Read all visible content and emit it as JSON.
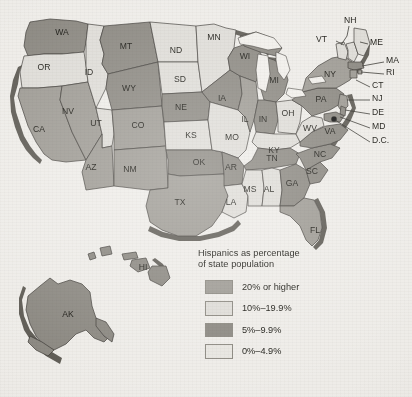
{
  "figure": {
    "background_color": "#eeece8",
    "outline_color": "#3a3732",
    "shadow_color": "#5d5a53",
    "lake_color": "#f1efeb",
    "dc_dot_color": "#111111"
  },
  "legend": {
    "title_line1": "Hispanics as percentage",
    "title_line2": "of state population",
    "items": [
      {
        "label": "20% or higher",
        "color": "#9d9a93"
      },
      {
        "label": "10%–19.9%",
        "color": "#dedcd7"
      },
      {
        "label": "5%–9.9%",
        "color": "#8a8780"
      },
      {
        "label": "0%–4.9%",
        "color": "#e7e5e0"
      }
    ]
  },
  "chart_data": {
    "type": "choropleth",
    "title": "Hispanics as percentage of state population",
    "xlabel": "",
    "ylabel": "",
    "grid": false,
    "legend_position": "bottom-center-right",
    "unit": "percent of state population",
    "bin_labels": [
      "20% or higher",
      "10%–19.9%",
      "5%–9.9%",
      "0%–4.9%"
    ],
    "bin_colors": [
      "#9d9a93",
      "#dedcd7",
      "#8a8780",
      "#e7e5e0"
    ],
    "states": [
      {
        "code": "WA",
        "bin": 2
      },
      {
        "code": "OR",
        "bin": 1
      },
      {
        "code": "CA",
        "bin": 0
      },
      {
        "code": "NV",
        "bin": 0
      },
      {
        "code": "ID",
        "bin": 1
      },
      {
        "code": "MT",
        "bin": 2
      },
      {
        "code": "WY",
        "bin": 2
      },
      {
        "code": "UT",
        "bin": 1
      },
      {
        "code": "AZ",
        "bin": 0
      },
      {
        "code": "CO",
        "bin": 0
      },
      {
        "code": "NM",
        "bin": 0
      },
      {
        "code": "ND",
        "bin": 1
      },
      {
        "code": "SD",
        "bin": 1
      },
      {
        "code": "NE",
        "bin": 2
      },
      {
        "code": "KS",
        "bin": 1
      },
      {
        "code": "OK",
        "bin": 2
      },
      {
        "code": "TX",
        "bin": 0
      },
      {
        "code": "MN",
        "bin": 1
      },
      {
        "code": "IA",
        "bin": 2
      },
      {
        "code": "MO",
        "bin": 1
      },
      {
        "code": "AR",
        "bin": 2
      },
      {
        "code": "LA",
        "bin": 1
      },
      {
        "code": "WI",
        "bin": 2
      },
      {
        "code": "IL",
        "bin": 0
      },
      {
        "code": "MI",
        "bin": 2
      },
      {
        "code": "IN",
        "bin": 2
      },
      {
        "code": "OH",
        "bin": 1
      },
      {
        "code": "KY",
        "bin": 1
      },
      {
        "code": "TN",
        "bin": 2
      },
      {
        "code": "MS",
        "bin": 1
      },
      {
        "code": "AL",
        "bin": 1
      },
      {
        "code": "GA",
        "bin": 2
      },
      {
        "code": "FL",
        "bin": 0
      },
      {
        "code": "SC",
        "bin": 2
      },
      {
        "code": "NC",
        "bin": 2
      },
      {
        "code": "VA",
        "bin": 2
      },
      {
        "code": "WV",
        "bin": 1
      },
      {
        "code": "PA",
        "bin": 2
      },
      {
        "code": "NY",
        "bin": 0
      },
      {
        "code": "VT",
        "bin": 1
      },
      {
        "code": "NH",
        "bin": 1
      },
      {
        "code": "ME",
        "bin": 1
      },
      {
        "code": "MA",
        "bin": 2
      },
      {
        "code": "RI",
        "bin": 0
      },
      {
        "code": "CT",
        "bin": 0
      },
      {
        "code": "NJ",
        "bin": 0
      },
      {
        "code": "DE",
        "bin": 2
      },
      {
        "code": "MD",
        "bin": 2
      },
      {
        "code": "D.C.",
        "bin": 2
      },
      {
        "code": "AK",
        "bin": 2
      },
      {
        "code": "HI",
        "bin": 2
      }
    ]
  },
  "labels": {
    "inline": [
      {
        "code": "WA",
        "x": 62,
        "y": 33
      },
      {
        "code": "OR",
        "x": 44,
        "y": 68
      },
      {
        "code": "CA",
        "x": 39,
        "y": 130
      },
      {
        "code": "NV",
        "x": 68,
        "y": 112
      },
      {
        "code": "ID",
        "x": 89,
        "y": 73
      },
      {
        "code": "MT",
        "x": 126,
        "y": 47
      },
      {
        "code": "WY",
        "x": 129,
        "y": 89
      },
      {
        "code": "UT",
        "x": 96,
        "y": 124
      },
      {
        "code": "AZ",
        "x": 91,
        "y": 168
      },
      {
        "code": "CO",
        "x": 138,
        "y": 126
      },
      {
        "code": "NM",
        "x": 130,
        "y": 170
      },
      {
        "code": "ND",
        "x": 176,
        "y": 51
      },
      {
        "code": "SD",
        "x": 180,
        "y": 80
      },
      {
        "code": "NE",
        "x": 181,
        "y": 108
      },
      {
        "code": "KS",
        "x": 191,
        "y": 136
      },
      {
        "code": "OK",
        "x": 199,
        "y": 163
      },
      {
        "code": "TX",
        "x": 180,
        "y": 203
      },
      {
        "code": "MN",
        "x": 214,
        "y": 38
      },
      {
        "code": "IA",
        "x": 222,
        "y": 99
      },
      {
        "code": "MO",
        "x": 232,
        "y": 138
      },
      {
        "code": "AR",
        "x": 231,
        "y": 168
      },
      {
        "code": "LA",
        "x": 231,
        "y": 203
      },
      {
        "code": "WI",
        "x": 245,
        "y": 57
      },
      {
        "code": "IL",
        "x": 245,
        "y": 120
      },
      {
        "code": "MI",
        "x": 274,
        "y": 81
      },
      {
        "code": "IN",
        "x": 263,
        "y": 120
      },
      {
        "code": "OH",
        "x": 288,
        "y": 114
      },
      {
        "code": "KY",
        "x": 274,
        "y": 151
      },
      {
        "code": "TN",
        "x": 272,
        "y": 159
      },
      {
        "code": "MS",
        "x": 250,
        "y": 190
      },
      {
        "code": "AL",
        "x": 269,
        "y": 190
      },
      {
        "code": "GA",
        "x": 292,
        "y": 184
      },
      {
        "code": "FL",
        "x": 315,
        "y": 231
      },
      {
        "code": "SC",
        "x": 312,
        "y": 172
      },
      {
        "code": "NC",
        "x": 320,
        "y": 155
      },
      {
        "code": "VA",
        "x": 330,
        "y": 132
      },
      {
        "code": "WV",
        "x": 310,
        "y": 129
      },
      {
        "code": "PA",
        "x": 321,
        "y": 100
      },
      {
        "code": "NY",
        "x": 330,
        "y": 75
      },
      {
        "code": "AK",
        "x": 68,
        "y": 315
      },
      {
        "code": "HI",
        "x": 143,
        "y": 268
      }
    ],
    "callouts": [
      {
        "code": "NH",
        "tx": 344,
        "ty": 21,
        "path": "M 349 26 L 347 36 L 341 45"
      },
      {
        "code": "VT",
        "tx": 327,
        "ty": 40,
        "path": "M 336 41 L 344 45"
      },
      {
        "code": "ME",
        "tx": 370,
        "ty": 43,
        "path": "M 368 44 L 360 42"
      },
      {
        "code": "MA",
        "tx": 386,
        "ty": 61,
        "path": "M 384 62 L 362 66"
      },
      {
        "code": "RI",
        "tx": 386,
        "ty": 73,
        "path": "M 384 74 L 361 72"
      },
      {
        "code": "CT",
        "tx": 372,
        "ty": 86,
        "path": "M 370 87 L 356 80"
      },
      {
        "code": "NJ",
        "tx": 372,
        "ty": 99,
        "path": "M 370 100 L 347 100"
      },
      {
        "code": "DE",
        "tx": 372,
        "ty": 113,
        "path": "M 370 114 L 345 110"
      },
      {
        "code": "MD",
        "tx": 372,
        "ty": 127,
        "path": "M 370 128 L 340 117"
      },
      {
        "code": "D.C.",
        "tx": 372,
        "ty": 141,
        "path": "M 370 142 L 335 120"
      }
    ],
    "dc_dot": {
      "x": 334,
      "y": 119,
      "r": 2.6
    }
  }
}
